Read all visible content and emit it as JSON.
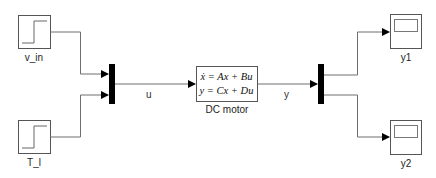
{
  "diagram": {
    "type": "simulink-block-diagram",
    "blocks": {
      "step_v_in": {
        "label": "v_in",
        "kind": "step-source"
      },
      "step_T_l": {
        "label": "T_l",
        "kind": "step-source"
      },
      "mux": {
        "kind": "mux",
        "inputs": 2
      },
      "state_space": {
        "label": "DC motor",
        "kind": "state-space",
        "eq1": "ẋ = Ax + Bu",
        "eq2": "y = Cx + Du"
      },
      "demux": {
        "kind": "demux",
        "outputs": 2
      },
      "scope_y1": {
        "label": "y1",
        "kind": "scope"
      },
      "scope_y2": {
        "label": "y2",
        "kind": "scope"
      }
    },
    "signals": {
      "u": "u",
      "y": "y"
    },
    "connections": [
      {
        "from": "v_in",
        "to": "mux.in1"
      },
      {
        "from": "T_l",
        "to": "mux.in2"
      },
      {
        "from": "mux",
        "to": "DC motor",
        "label": "u"
      },
      {
        "from": "DC motor",
        "to": "demux",
        "label": "y"
      },
      {
        "from": "demux.out1",
        "to": "y1"
      },
      {
        "from": "demux.out2",
        "to": "y2"
      }
    ],
    "colors": {
      "line": "#6e6e6e",
      "block_border": "#555555",
      "bar": "#000000"
    }
  }
}
